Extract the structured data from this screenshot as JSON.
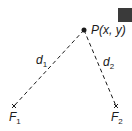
{
  "diagram": {
    "point_label": "P(x, y)",
    "distance1_label": "d",
    "distance1_sub": "1",
    "distance2_label": "d",
    "distance2_sub": "2",
    "focus1_label": "F",
    "focus1_sub": "1",
    "focus2_label": "F",
    "focus2_sub": "2",
    "colors": {
      "ink": "#1a1a1a",
      "corner_square": "#3a3a3a"
    }
  }
}
